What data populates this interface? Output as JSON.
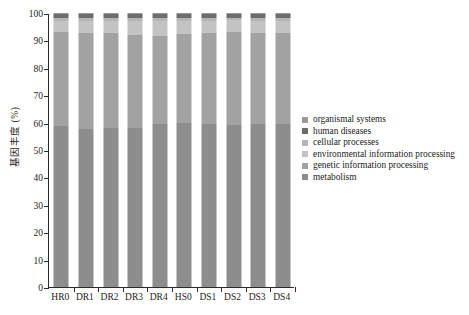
{
  "chart_data": {
    "type": "bar",
    "stacked": true,
    "normalized_percent": true,
    "title": "",
    "xlabel": "",
    "ylabel": "基因丰度 (%)",
    "ylim": [
      0,
      100
    ],
    "yticks": [
      0,
      10,
      20,
      30,
      40,
      50,
      60,
      70,
      80,
      90,
      100
    ],
    "grid": false,
    "legend_position": "right",
    "categories": [
      "HR0",
      "DR1",
      "DR2",
      "DR3",
      "DR4",
      "HS0",
      "DS1",
      "DS2",
      "DS3",
      "DS4"
    ],
    "series": [
      {
        "name": "metabolism",
        "color": "#8d8d8d",
        "values": [
          58.6,
          57.6,
          58.1,
          58.2,
          59.4,
          59.9,
          59.6,
          59.3,
          59.6,
          59.5
        ]
      },
      {
        "name": "genetic information processing",
        "color": "#a2a2a2",
        "values": [
          34.4,
          35.0,
          34.7,
          33.6,
          32.2,
          32.6,
          33.2,
          33.7,
          33.1,
          33.3
        ]
      },
      {
        "name": "environmental information processing",
        "color": "#c3c3c3",
        "values": [
          4.1,
          4.5,
          4.3,
          5.2,
          5.4,
          4.6,
          4.4,
          4.3,
          4.5,
          4.4
        ]
      },
      {
        "name": "cellular processes",
        "color": "#b5b5b5",
        "values": [
          1.0,
          1.0,
          1.0,
          1.1,
          1.1,
          1.0,
          1.0,
          1.0,
          1.0,
          1.0
        ]
      },
      {
        "name": "human diseases",
        "color": "#6d6d6d",
        "values": [
          1.5,
          1.5,
          1.5,
          1.5,
          1.5,
          1.5,
          1.4,
          1.4,
          1.4,
          1.4
        ]
      },
      {
        "name": "organismal systems",
        "color": "#9a9a9a",
        "values": [
          0.4,
          0.4,
          0.4,
          0.4,
          0.4,
          0.4,
          0.4,
          0.3,
          0.4,
          0.4
        ]
      }
    ],
    "legend_entries": [
      {
        "label": "organismal systems",
        "color": "#9a9a9a"
      },
      {
        "label": "human diseases",
        "color": "#6d6d6d"
      },
      {
        "label": "cellular processes",
        "color": "#b5b5b5"
      },
      {
        "label": "environmental information processing",
        "color": "#c3c3c3"
      },
      {
        "label": "genetic information processing",
        "color": "#a2a2a2"
      },
      {
        "label": "metabolism",
        "color": "#8d8d8d"
      }
    ]
  },
  "axis": {
    "y_label": "基因丰度 (%)",
    "y_tick_labels": [
      "0",
      "10",
      "20",
      "30",
      "40",
      "50",
      "60",
      "70",
      "80",
      "90",
      "100"
    ],
    "x_tick_labels": [
      "HR0",
      "DR1",
      "DR2",
      "DR3",
      "DR4",
      "HS0",
      "DS1",
      "DS2",
      "DS3",
      "DS4"
    ]
  },
  "colors": {
    "axis": "#2b2b2b",
    "background": "#ffffff",
    "text": "#1c1c1c"
  }
}
